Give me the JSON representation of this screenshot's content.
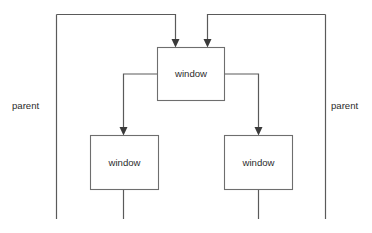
{
  "diagram": {
    "type": "window-hierarchy-tree",
    "background_color": "#ffffff",
    "line_color": "#5a5a5a",
    "box_stroke_color": "#6e6e6e",
    "text_color": "#2b2b2b",
    "nodes": [
      {
        "id": "top-window",
        "label": "window",
        "x": 157,
        "y": 47,
        "w": 67,
        "h": 53
      },
      {
        "id": "left-window",
        "label": "window",
        "x": 90,
        "y": 135,
        "w": 68,
        "h": 55
      },
      {
        "id": "right-window",
        "label": "window",
        "x": 224,
        "y": 135,
        "w": 68,
        "h": 55
      }
    ],
    "labels": [
      {
        "id": "parent-left",
        "text": "parent",
        "x": 12,
        "y": 106
      },
      {
        "id": "parent-right",
        "text": "parent",
        "x": 331,
        "y": 106
      }
    ],
    "edges": [
      {
        "id": "edge-parent-left-to-top",
        "from": "parent-left-bus",
        "to": "top-window",
        "arrow": true
      },
      {
        "id": "edge-parent-right-to-top",
        "from": "parent-right-bus",
        "to": "top-window",
        "arrow": true
      },
      {
        "id": "edge-top-to-left",
        "from": "top-window",
        "to": "left-window",
        "arrow": true
      },
      {
        "id": "edge-top-to-right",
        "from": "top-window",
        "to": "right-window",
        "arrow": true
      },
      {
        "id": "stub-left",
        "from": "left-window",
        "to": "below",
        "arrow": false
      },
      {
        "id": "stub-right",
        "from": "right-window",
        "to": "below",
        "arrow": false
      }
    ]
  }
}
